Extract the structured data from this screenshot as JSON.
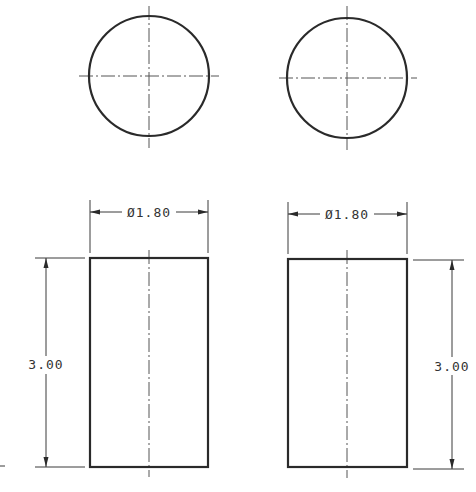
{
  "drawing": {
    "type": "orthographic engineering drawing",
    "views": [
      {
        "id": "top-view-left",
        "kind": "circle",
        "center": [
          149,
          76
        ],
        "radius": 60
      },
      {
        "id": "top-view-right",
        "kind": "circle",
        "center": [
          347,
          78
        ],
        "radius": 60
      },
      {
        "id": "front-view-left",
        "kind": "rectangle",
        "x": 90,
        "y": 258,
        "width": 118,
        "height": 209
      },
      {
        "id": "front-view-right",
        "kind": "rectangle",
        "x": 288,
        "y": 259,
        "width": 119,
        "height": 208
      }
    ],
    "dimensions": {
      "left_diameter": "Ø1.80",
      "right_diameter": "Ø1.80",
      "left_height": "3.00",
      "right_height": "3.00"
    },
    "colors": {
      "line": "#2a2a2a",
      "center_line": "#555555",
      "background": "#ffffff"
    }
  }
}
